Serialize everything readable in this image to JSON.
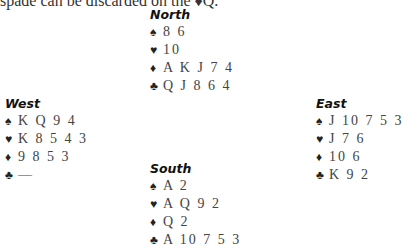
{
  "intro_text": "spade can be discarded on the ♦Q.",
  "hands": {
    "north": {
      "title": "North",
      "spades": "8 6",
      "hearts": "10",
      "diamonds": "A K J 7 4",
      "clubs": "Q J 8 6 4"
    },
    "west": {
      "title": "West",
      "spades": "K Q 9 4",
      "hearts": "K 8 5 4 3",
      "diamonds": "9 8 5 3",
      "clubs": "—"
    },
    "east": {
      "title": "East",
      "spades": "J 10 7 5 3",
      "hearts": "J 7 6",
      "diamonds": "10 6",
      "clubs": "K 9 2"
    },
    "south": {
      "title": "South",
      "spades": "A 2",
      "hearts": "A Q 9 2",
      "diamonds": "Q 2",
      "clubs": "A 10 7 5 3"
    }
  },
  "icons": {
    "spade": "♠",
    "heart": "♥",
    "diamond": "♦",
    "club": "♣"
  }
}
